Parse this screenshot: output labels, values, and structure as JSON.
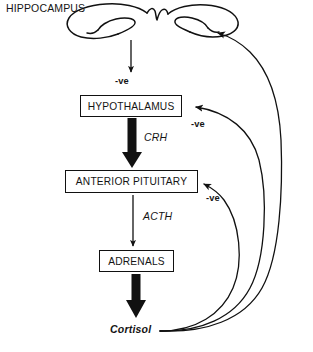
{
  "diagram": {
    "title": "HIPPOCAMPUS",
    "type": "flowchart",
    "nodes": {
      "hypothalamus": "HYPOTHALAMUS",
      "anterior_pituitary": "ANTERIOR PITUITARY",
      "adrenals": "ADRENALS"
    },
    "hormones": {
      "crh": "CRH",
      "acth": "ACTH",
      "cortisol": "Cortisol"
    },
    "feedback": {
      "to_hypothalamus_from_hippocampus": "-ve",
      "to_hypothalamus_from_cortisol": "-ve",
      "to_pituitary_from_cortisol": "-ve"
    },
    "colors": {
      "stroke": "#111111",
      "text": "#141414",
      "background": "#ffffff"
    }
  }
}
